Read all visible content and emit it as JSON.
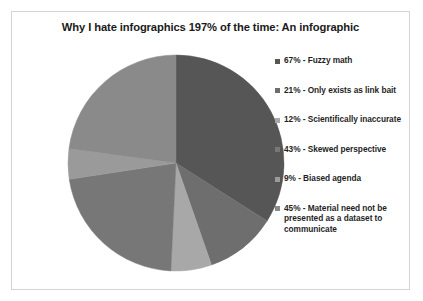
{
  "frame": {
    "border_color": "#d4d4d4",
    "background": "#ffffff"
  },
  "title": "Why I hate infographics 197% of the time: An infographic",
  "chart_data": {
    "type": "pie",
    "title": "Why I hate infographics 197% of the time: An infographic",
    "xlabel": "",
    "ylabel": "",
    "legend_position": "right",
    "grid": false,
    "total_percent": 197,
    "note": "Stated percentages sum to 197%, slices drawn normalized to 360 degrees",
    "categories": [
      "Fuzzy math",
      "Only exists as link bait",
      "Scientifically inaccurate",
      "Skewed perspective",
      "Biased agenda",
      "Material need not be presented as a dataset to communicate"
    ],
    "values": [
      67,
      21,
      12,
      43,
      9,
      45
    ],
    "colors": [
      "#565656",
      "#6e6e6e",
      "#a8a8a8",
      "#777777",
      "#9a9a9a",
      "#8a8a8a"
    ],
    "slices": [
      {
        "label": "Fuzzy math",
        "value": 67,
        "color": "#565656",
        "start_angle": 0,
        "end_angle": 122.4
      },
      {
        "label": "Only exists as link bait",
        "value": 21,
        "color": "#6e6e6e",
        "start_angle": 122.4,
        "end_angle": 160.8
      },
      {
        "label": "Scientifically inaccurate",
        "value": 12,
        "color": "#a8a8a8",
        "start_angle": 160.8,
        "end_angle": 182.7
      },
      {
        "label": "Skewed perspective",
        "value": 43,
        "color": "#777777",
        "start_angle": 182.7,
        "end_angle": 261.3
      },
      {
        "label": "Biased agenda",
        "value": 9,
        "color": "#9a9a9a",
        "start_angle": 261.3,
        "end_angle": 277.7
      },
      {
        "label": "Material need not be presented as a dataset to communicate",
        "value": 45,
        "color": "#8a8a8a",
        "start_angle": 277.7,
        "end_angle": 360
      }
    ]
  },
  "legend": {
    "items": [
      {
        "marker_color": "#565656",
        "label": "67% - Fuzzy math"
      },
      {
        "marker_color": "#6e6e6e",
        "label": "21% - Only exists as link bait"
      },
      {
        "marker_color": "#a8a8a8",
        "label": "12%  - Scientifically inaccurate"
      },
      {
        "marker_color": "#777777",
        "label": "43% - Skewed perspective"
      },
      {
        "marker_color": "#9a9a9a",
        "label": "9% - Biased agenda"
      },
      {
        "marker_color": "#8a8a8a",
        "label": "45% - Material need not be presented as a dataset to communicate"
      }
    ]
  }
}
